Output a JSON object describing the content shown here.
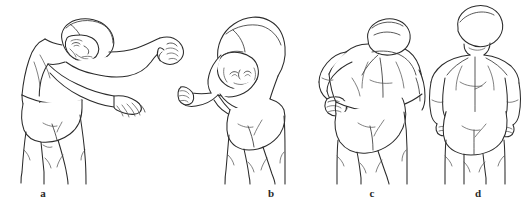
{
  "figure": {
    "kind": "anatomical-line-drawing",
    "background_color": "#ffffff",
    "line_color": "#2b2b2b",
    "detail_line_color": "#3a3a3a",
    "panel_count": 4,
    "labels": [
      {
        "id": "a",
        "text": "a",
        "x": 43
      },
      {
        "id": "b",
        "text": "b",
        "x": 271
      },
      {
        "id": "c",
        "text": "c",
        "x": 372
      },
      {
        "id": "d",
        "text": "d",
        "x": 478
      }
    ],
    "panels": [
      {
        "id": "a",
        "label": "a",
        "view": "three-quarter-side",
        "pose": "trunk flexed forward, both arms extended forward and down, head turned down with face in profile",
        "left": 10,
        "width": 190
      },
      {
        "id": "b",
        "label": "b",
        "view": "side",
        "pose": "trunk flexed forward deeply, head hanging with face visible upside-down, arms extended forward with closed fists",
        "left": 178,
        "width": 150
      },
      {
        "id": "c",
        "label": "c",
        "view": "posterior",
        "pose": "back view, trunk rotated, one arm bent at elbow with closed fist raised in front of chest",
        "left": 312,
        "width": 118
      },
      {
        "id": "d",
        "label": "d",
        "view": "posterior",
        "pose": "back view standing upright, arms relaxed at sides, head neutral",
        "left": 424,
        "width": 98
      }
    ]
  }
}
